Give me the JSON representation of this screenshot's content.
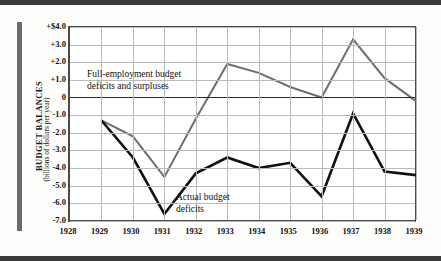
{
  "chart_data": {
    "type": "line",
    "title": "",
    "xlabel": "",
    "ylabel": "BUDGET BALANCES",
    "ylabel_sub": "(billions of dollars per year)",
    "x": [
      1928,
      1929,
      1930,
      1931,
      1932,
      1933,
      1934,
      1935,
      1936,
      1937,
      1938,
      1939
    ],
    "xtick_labels": [
      "1928",
      "1929",
      "1930",
      "1931",
      "1932",
      "1933",
      "1934",
      "1935",
      "1936",
      "1937",
      "1938",
      "1939"
    ],
    "ytick_labels": [
      "+$4.0",
      "+3.0",
      "+2.0",
      "+1.0",
      "0",
      "-1.0",
      "-2.0",
      "-3.0",
      "-4.0",
      "-5.0",
      "-6.0",
      "-7.0"
    ],
    "ytick_values": [
      4.0,
      3.0,
      2.0,
      1.0,
      0,
      -1.0,
      -2.0,
      -3.0,
      -4.0,
      -5.0,
      -6.0,
      -7.0
    ],
    "ylim": [
      -7.0,
      4.0
    ],
    "xlim": [
      1928,
      1939
    ],
    "grid": true,
    "legend_position": "inline-annotations",
    "series": [
      {
        "name": "Full-employment budget deficits and surpluses",
        "color": "#6e6e6e",
        "x": [
          1929,
          1930,
          1931,
          1932,
          1933,
          1934,
          1935,
          1936,
          1937,
          1938,
          1939
        ],
        "values": [
          -1.3,
          -2.2,
          -4.5,
          -1.2,
          1.9,
          1.4,
          0.6,
          0.0,
          3.3,
          1.1,
          -0.2
        ]
      },
      {
        "name": "Actual budget deficits",
        "color": "#111111",
        "x": [
          1929,
          1930,
          1931,
          1932,
          1933,
          1934,
          1935,
          1936,
          1937,
          1938,
          1939
        ],
        "values": [
          -1.3,
          -3.4,
          -6.6,
          -4.3,
          -3.4,
          -4.0,
          -3.7,
          -5.6,
          -0.9,
          -4.2,
          -4.4
        ]
      }
    ],
    "annotations": [
      {
        "id": "full-employment",
        "text_line1": "Full-employment budget",
        "text_line2": "deficits and surpluses"
      },
      {
        "id": "actual",
        "text_line1": "Actual budget",
        "text_line2": "deficits"
      }
    ]
  },
  "colors": {
    "series_gray": "#6e6e6e",
    "series_black": "#111111",
    "grid": "#b9b9b9",
    "frame": "#4a4a4a",
    "rule": "#3a3a3a"
  }
}
